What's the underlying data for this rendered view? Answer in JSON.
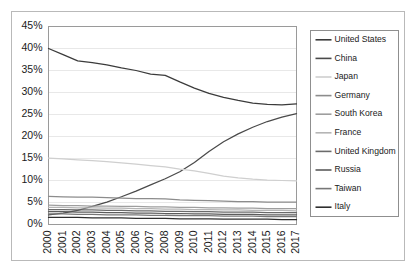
{
  "chart_data": {
    "type": "line",
    "title": "",
    "subtitle": "",
    "xlabel": "",
    "ylabel": "",
    "grid": true,
    "legend_position": "right",
    "x": [
      2000,
      2001,
      2002,
      2003,
      2004,
      2005,
      2006,
      2007,
      2008,
      2009,
      2010,
      2011,
      2012,
      2013,
      2014,
      2015,
      2016,
      2017
    ],
    "xtick_labels": [
      "2000",
      "2001",
      "2002",
      "2003",
      "2004",
      "2005",
      "2006",
      "2007",
      "2008",
      "2009",
      "2010",
      "2011",
      "2012",
      "2013",
      "2014",
      "2015",
      "2016",
      "2017"
    ],
    "ytick_labels": [
      "0%",
      "5%",
      "10%",
      "15%",
      "20%",
      "25%",
      "30%",
      "35%",
      "40%",
      "45%"
    ],
    "ytick_values": [
      0,
      5,
      10,
      15,
      20,
      25,
      30,
      35,
      40,
      45
    ],
    "ylim": [
      0,
      45
    ],
    "yunit": "%",
    "series": [
      {
        "name": "United States",
        "color": "#3b3b3b",
        "values": [
          40.0,
          38.6,
          37.2,
          36.8,
          36.3,
          35.6,
          35.0,
          34.2,
          33.9,
          32.4,
          31.0,
          29.8,
          28.9,
          28.2,
          27.6,
          27.3,
          27.2,
          27.4
        ]
      },
      {
        "name": "China",
        "color": "#4a4a4a",
        "values": [
          2.2,
          2.6,
          3.2,
          4.1,
          5.1,
          6.3,
          7.6,
          9.0,
          10.4,
          12.0,
          14.1,
          16.6,
          18.8,
          20.6,
          22.1,
          23.4,
          24.4,
          25.2
        ]
      },
      {
        "name": "Japan",
        "color": "#cfcfcf",
        "values": [
          15.1,
          14.9,
          14.7,
          14.5,
          14.3,
          14.0,
          13.7,
          13.4,
          13.1,
          12.6,
          12.2,
          11.6,
          11.0,
          10.6,
          10.3,
          10.1,
          10.0,
          9.9
        ]
      },
      {
        "name": "Germany",
        "color": "#8c8c8c",
        "values": [
          6.4,
          6.3,
          6.2,
          6.2,
          6.1,
          6.0,
          5.9,
          5.9,
          5.8,
          5.6,
          5.5,
          5.4,
          5.3,
          5.2,
          5.2,
          5.1,
          5.1,
          5.1
        ]
      },
      {
        "name": "South Korea",
        "color": "#9e9e9e",
        "values": [
          4.4,
          4.3,
          4.3,
          4.2,
          4.2,
          4.1,
          4.1,
          4.0,
          4.0,
          3.9,
          3.9,
          3.8,
          3.8,
          3.7,
          3.7,
          3.6,
          3.6,
          3.6
        ]
      },
      {
        "name": "France",
        "color": "#b5b5b5",
        "values": [
          3.9,
          3.9,
          3.8,
          3.8,
          3.7,
          3.7,
          3.6,
          3.6,
          3.5,
          3.5,
          3.4,
          3.4,
          3.3,
          3.3,
          3.2,
          3.2,
          3.2,
          3.1
        ]
      },
      {
        "name": "United Kingdom",
        "color": "#6b6b6b",
        "values": [
          3.4,
          3.4,
          3.3,
          3.3,
          3.2,
          3.2,
          3.1,
          3.1,
          3.0,
          3.0,
          2.9,
          2.9,
          2.8,
          2.8,
          2.8,
          2.7,
          2.7,
          2.7
        ]
      },
      {
        "name": "Russia",
        "color": "#5c5c5c",
        "values": [
          2.9,
          2.9,
          2.8,
          2.8,
          2.7,
          2.7,
          2.6,
          2.6,
          2.5,
          2.5,
          2.4,
          2.4,
          2.3,
          2.3,
          2.3,
          2.2,
          2.2,
          2.2
        ]
      },
      {
        "name": "Taiwan",
        "color": "#777777",
        "values": [
          2.4,
          2.4,
          2.3,
          2.3,
          2.2,
          2.2,
          2.2,
          2.1,
          2.1,
          2.0,
          2.0,
          2.0,
          1.9,
          1.9,
          1.9,
          1.8,
          1.8,
          1.8
        ]
      },
      {
        "name": "Italy",
        "color": "#2e2e2e",
        "values": [
          1.6,
          1.6,
          1.6,
          1.5,
          1.5,
          1.5,
          1.4,
          1.4,
          1.4,
          1.3,
          1.3,
          1.3,
          1.2,
          1.2,
          1.2,
          1.2,
          1.1,
          1.1
        ]
      }
    ]
  },
  "legend": {
    "items": [
      {
        "label": "United States"
      },
      {
        "label": "China"
      },
      {
        "label": "Japan"
      },
      {
        "label": "Germany"
      },
      {
        "label": "South Korea"
      },
      {
        "label": "France"
      },
      {
        "label": "United Kingdom"
      },
      {
        "label": "Russia"
      },
      {
        "label": "Taiwan"
      },
      {
        "label": "Italy"
      }
    ]
  }
}
